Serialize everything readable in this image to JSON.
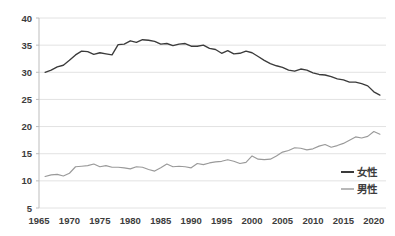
{
  "chart_data": {
    "type": "line",
    "title": "",
    "subtitle": "",
    "xlabel": "",
    "ylabel": "",
    "xlim": [
      1965,
      2022
    ],
    "ylim": [
      5,
      40
    ],
    "y_ticks": [
      5,
      10,
      15,
      20,
      25,
      30,
      35,
      40
    ],
    "x_ticks": [
      1965,
      1970,
      1975,
      1980,
      1985,
      1990,
      1995,
      2000,
      2005,
      2010,
      2015,
      2020
    ],
    "grid": "horizontal",
    "legend_position": "inside-right",
    "legend": [
      "女性",
      "男性"
    ],
    "x": [
      1966,
      1967,
      1968,
      1969,
      1970,
      1971,
      1972,
      1973,
      1974,
      1975,
      1976,
      1977,
      1978,
      1979,
      1980,
      1981,
      1982,
      1983,
      1984,
      1985,
      1986,
      1987,
      1988,
      1989,
      1990,
      1991,
      1992,
      1993,
      1994,
      1995,
      1996,
      1997,
      1998,
      1999,
      2000,
      2001,
      2002,
      2003,
      2004,
      2005,
      2006,
      2007,
      2008,
      2009,
      2010,
      2011,
      2012,
      2013,
      2014,
      2015,
      2016,
      2017,
      2018,
      2019,
      2020,
      2021
    ],
    "series": [
      {
        "name": "女性",
        "color": "#3b3b3b",
        "values": [
          30.0,
          30.4,
          31.0,
          31.3,
          32.2,
          33.2,
          33.9,
          33.8,
          33.3,
          33.6,
          33.4,
          33.2,
          35.1,
          35.2,
          35.8,
          35.5,
          36.0,
          35.9,
          35.7,
          35.2,
          35.3,
          34.9,
          35.2,
          35.3,
          34.8,
          34.8,
          35.0,
          34.4,
          34.2,
          33.5,
          34.0,
          33.4,
          33.5,
          33.9,
          33.6,
          32.9,
          32.2,
          31.6,
          31.2,
          30.9,
          30.4,
          30.2,
          30.6,
          30.4,
          29.9,
          29.6,
          29.5,
          29.2,
          28.8,
          28.6,
          28.2,
          28.2,
          27.9,
          27.5,
          26.4,
          25.8
        ]
      },
      {
        "name": "男性",
        "color": "#9a9a9a",
        "values": [
          10.8,
          11.1,
          11.2,
          10.9,
          11.4,
          12.6,
          12.7,
          12.8,
          13.1,
          12.6,
          12.8,
          12.5,
          12.5,
          12.4,
          12.2,
          12.6,
          12.5,
          12.1,
          11.8,
          12.4,
          13.1,
          12.6,
          12.7,
          12.6,
          12.4,
          13.2,
          13.0,
          13.3,
          13.5,
          13.6,
          13.9,
          13.6,
          13.2,
          13.4,
          14.6,
          14.0,
          13.9,
          14.0,
          14.6,
          15.3,
          15.6,
          16.1,
          16.0,
          15.7,
          15.9,
          16.4,
          16.7,
          16.2,
          16.5,
          16.9,
          17.5,
          18.1,
          17.9,
          18.2,
          19.1,
          18.6
        ]
      }
    ]
  }
}
